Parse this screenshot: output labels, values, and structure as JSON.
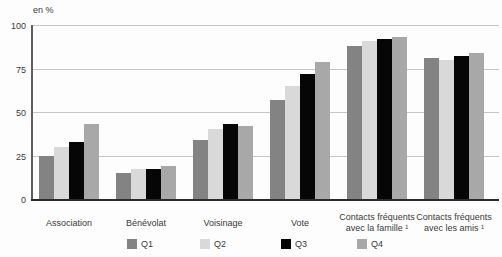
{
  "chart_data": {
    "type": "bar",
    "title": "",
    "unit": "en %",
    "ylabel": "en %",
    "xlabel": "",
    "ylim": [
      0,
      100
    ],
    "yticks": [
      0,
      25,
      50,
      75,
      100
    ],
    "grid": true,
    "legend_position": "bottom",
    "categories": [
      "Association",
      "Bénévolat",
      "Voisinage",
      "Vote",
      "Contacts fréquents avec la famille ¹",
      "Contacts fréquents avec les amis ¹"
    ],
    "series": [
      {
        "name": "Q1",
        "color": "#838383",
        "values": [
          25,
          15,
          34,
          57,
          88,
          81
        ]
      },
      {
        "name": "Q2",
        "color": "#d9d9d9",
        "values": [
          30,
          17,
          40,
          65,
          91,
          80
        ]
      },
      {
        "name": "Q3",
        "color": "#060606",
        "values": [
          33,
          17,
          43,
          72,
          92,
          82
        ]
      },
      {
        "name": "Q4",
        "color": "#a8a8a8",
        "values": [
          43,
          19,
          42,
          79,
          93,
          84
        ]
      }
    ],
    "legend": [
      "Q1",
      "Q2",
      "Q3",
      "Q4"
    ]
  }
}
